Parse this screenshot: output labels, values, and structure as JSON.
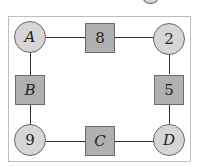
{
  "diagram": {
    "type": "cycle-graph",
    "nodes": [
      {
        "id": "A",
        "label": "A",
        "shape": "circle",
        "italic": true
      },
      {
        "id": "top",
        "label": "8",
        "shape": "square",
        "italic": false
      },
      {
        "id": "tr",
        "label": "2",
        "shape": "circle",
        "italic": false
      },
      {
        "id": "right",
        "label": "5",
        "shape": "square",
        "italic": false
      },
      {
        "id": "D",
        "label": "D",
        "shape": "circle",
        "italic": true
      },
      {
        "id": "bottom",
        "label": "C",
        "shape": "square",
        "italic": true
      },
      {
        "id": "bl",
        "label": "9",
        "shape": "circle",
        "italic": false
      },
      {
        "id": "left",
        "label": "B",
        "shape": "square",
        "italic": true
      }
    ],
    "edges": [
      [
        "A",
        "top"
      ],
      [
        "top",
        "tr"
      ],
      [
        "tr",
        "right"
      ],
      [
        "right",
        "D"
      ],
      [
        "D",
        "bottom"
      ],
      [
        "bottom",
        "bl"
      ],
      [
        "bl",
        "left"
      ],
      [
        "left",
        "A"
      ]
    ],
    "colors": {
      "circle_fill": "#d6d6d6",
      "square_fill": "#b0b0b0",
      "stroke": "#333333"
    }
  }
}
